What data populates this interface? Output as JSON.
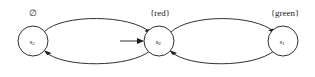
{
  "figure": {
    "type": "state-transition-diagram",
    "title": "",
    "background_color": "#ffffff",
    "stroke_color": "#1a1a1a",
    "width": 315,
    "height": 77
  },
  "states": [
    {
      "id": "s2",
      "name": "s",
      "subscript": "2",
      "label_full": "s2",
      "proposition_label": "∅",
      "cx": 33,
      "cy": 41,
      "r": 15,
      "is_initial": false
    },
    {
      "id": "s0",
      "name": "s",
      "subscript": "0",
      "label_full": "s0",
      "proposition_label": "{red}",
      "cx": 159,
      "cy": 41,
      "r": 15,
      "is_initial": true
    },
    {
      "id": "s1",
      "name": "s",
      "subscript": "1",
      "label_full": "s1",
      "proposition_label": "{green}",
      "cx": 283,
      "cy": 41,
      "r": 15,
      "is_initial": false
    }
  ],
  "transitions": [
    {
      "id": "t-s2-s0-top",
      "from": "s2",
      "to": "s0",
      "label": "",
      "direction": "top-curve"
    },
    {
      "id": "t-s0-s2-bottom",
      "from": "s0",
      "to": "s2",
      "label": "",
      "direction": "bottom-curve"
    },
    {
      "id": "t-s0-s1-top",
      "from": "s0",
      "to": "s1",
      "label": "",
      "direction": "top-curve"
    },
    {
      "id": "t-s1-s0-bottom",
      "from": "s1",
      "to": "s0",
      "label": "",
      "direction": "bottom-curve"
    }
  ],
  "initial_marker": {
    "id": "initial-arrow",
    "target": "s0",
    "label": "",
    "x_start": 120,
    "x_end": 143,
    "y": 41
  }
}
